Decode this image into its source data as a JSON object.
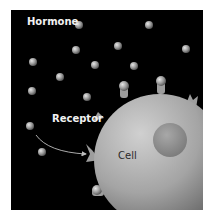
{
  "diagram": {
    "labels": {
      "hormone": "Hormone",
      "receptor": "Receptor",
      "cell": "Cell"
    },
    "colors": {
      "background": "#000000",
      "hormone": "#9a9a9a",
      "cell": "#a8a8a8",
      "nucleus": "#8c8c8c",
      "text_light": "#f2f2f2",
      "text_dark": "#2a2a2a"
    },
    "hormones": [
      [
        79,
        25
      ],
      [
        76,
        50
      ],
      [
        33,
        62
      ],
      [
        95,
        65
      ],
      [
        60,
        77
      ],
      [
        143,
        23
      ],
      [
        142,
        50
      ],
      [
        184,
        48
      ],
      [
        130,
        66
      ],
      [
        32,
        91
      ],
      [
        87,
        97
      ],
      [
        27,
        127
      ],
      [
        42,
        150
      ]
    ],
    "arrow": {
      "from": "free hormone",
      "to": "receptor"
    }
  }
}
